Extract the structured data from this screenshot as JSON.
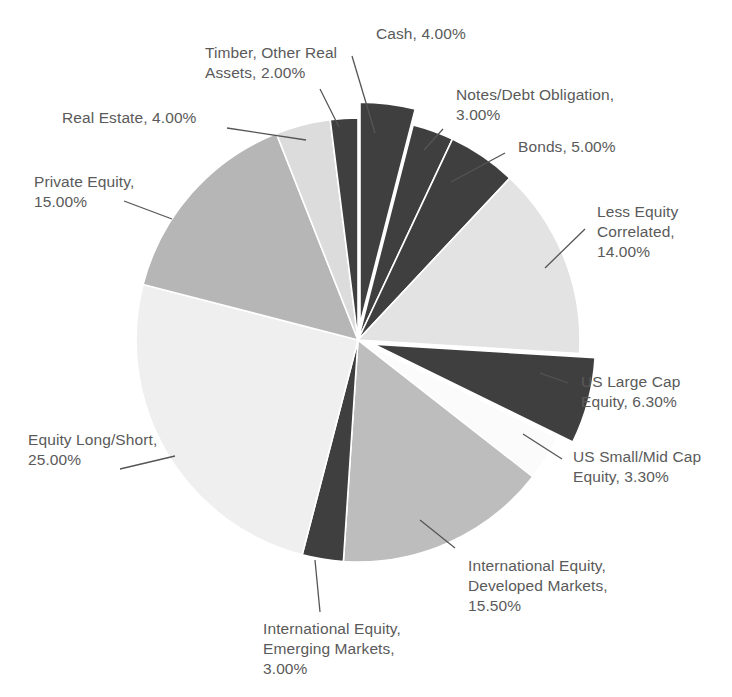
{
  "chart_data": {
    "type": "pie",
    "title": "",
    "subtitle": "",
    "xlabel": "",
    "ylabel": "",
    "legend_position": "none",
    "grid": false,
    "start_angle_deg": 0,
    "direction": "clockwise",
    "units": "percent",
    "total": 100.0,
    "categories": [
      "Cash",
      "Notes/Debt Obligation",
      "Bonds",
      "Less Equity Correlated",
      "US Large Cap Equity",
      "US Small/Mid Cap Equity",
      "International Equity, Developed Markets",
      "International Equity, Emerging Markets",
      "Equity Long/Short",
      "Private Equity",
      "Real Estate",
      "Timber, Other Real Assets"
    ],
    "values": [
      4.0,
      3.0,
      5.0,
      14.0,
      6.3,
      3.3,
      15.5,
      3.0,
      25.0,
      15.0,
      4.0,
      2.0
    ],
    "colors": [
      "#3f3f3f",
      "#3f3f3f",
      "#3f3f3f",
      "#e3e3e3",
      "#3f3f3f",
      "#fbfbfb",
      "#bdbdbd",
      "#3f3f3f",
      "#efefef",
      "#b6b6b6",
      "#dcdcdc",
      "#3f3f3f"
    ],
    "exploded": [
      true,
      false,
      false,
      false,
      true,
      false,
      false,
      false,
      false,
      false,
      false,
      false
    ],
    "slices": [
      {
        "label": "Cash",
        "value": 4.0,
        "value_text": "4.00%",
        "color": "#3f3f3f"
      },
      {
        "label": "Notes/Debt Obligation",
        "value": 3.0,
        "value_text": "3.00%",
        "color": "#3f3f3f"
      },
      {
        "label": "Bonds",
        "value": 5.0,
        "value_text": "5.00%",
        "color": "#3f3f3f"
      },
      {
        "label": "Less Equity Correlated",
        "value": 14.0,
        "value_text": "14.00%",
        "color": "#e3e3e3"
      },
      {
        "label": "US Large Cap Equity",
        "value": 6.3,
        "value_text": "6.30%",
        "color": "#3f3f3f"
      },
      {
        "label": "US Small/Mid Cap Equity",
        "value": 3.3,
        "value_text": "3.30%",
        "color": "#fbfbfb"
      },
      {
        "label": "International Equity, Developed Markets",
        "value": 15.5,
        "value_text": "15.50%",
        "color": "#bdbdbd"
      },
      {
        "label": "International Equity, Emerging Markets",
        "value": 3.0,
        "value_text": "3.00%",
        "color": "#3f3f3f"
      },
      {
        "label": "Equity Long/Short",
        "value": 25.0,
        "value_text": "25.00%",
        "color": "#efefef"
      },
      {
        "label": "Private Equity",
        "value": 15.0,
        "value_text": "15.00%",
        "color": "#b6b6b6"
      },
      {
        "label": "Real Estate",
        "value": 4.0,
        "value_text": "4.00%",
        "color": "#dcdcdc"
      },
      {
        "label": "Timber, Other Real Assets",
        "value": 2.0,
        "value_text": "2.00%",
        "color": "#3f3f3f"
      }
    ]
  },
  "labels": {
    "cash": "Cash, 4.00%",
    "notes_debt": "Notes/Debt Obligation,\n3.00%",
    "bonds": "Bonds, 5.00%",
    "less_equity_correlated": "Less Equity\nCorrelated,\n14.00%",
    "us_large_cap": "US Large Cap\nEquity, 6.30%",
    "us_small_mid_cap": "US Small/Mid Cap\nEquity, 3.30%",
    "intl_developed": "International Equity,\nDeveloped Markets,\n15.50%",
    "intl_emerging": "International Equity,\nEmerging Markets,\n3.00%",
    "equity_long_short": "Equity Long/Short,\n25.00%",
    "private_equity": "Private Equity,\n15.00%",
    "real_estate": "Real Estate, 4.00%",
    "timber": "Timber, Other Real\nAssets, 2.00%"
  },
  "style": {
    "background": "#ffffff",
    "label_color": "#5a5a5a",
    "leader_line_color": "#555555",
    "slice_separator_color": "#ffffff"
  }
}
